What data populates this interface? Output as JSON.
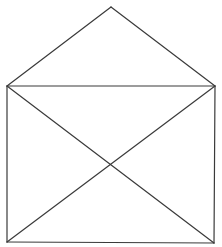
{
  "diagram": {
    "background": "#ffffff",
    "stroke_color": "#3a3a3a",
    "stroke_width": 1.2,
    "points": {
      "apex": [
        111,
        7
      ],
      "top_left": [
        7,
        86
      ],
      "top_right": [
        215,
        86
      ],
      "bottom_left": [
        7,
        242
      ],
      "bottom_right": [
        214,
        243
      ]
    },
    "segments": [
      {
        "name": "roof-left",
        "from": "apex",
        "to": "top_left"
      },
      {
        "name": "roof-right",
        "from": "apex",
        "to": "top_right"
      },
      {
        "name": "top-edge",
        "from": "top_left",
        "to": "top_right"
      },
      {
        "name": "left-edge",
        "from": "top_left",
        "to": "bottom_left"
      },
      {
        "name": "right-edge",
        "from": "top_right",
        "to": "bottom_right"
      },
      {
        "name": "bottom-edge",
        "from": "bottom_left",
        "to": "bottom_right"
      },
      {
        "name": "diagonal-down",
        "from": "top_left",
        "to": "bottom_right"
      },
      {
        "name": "diagonal-up",
        "from": "bottom_left",
        "to": "top_right"
      }
    ]
  }
}
